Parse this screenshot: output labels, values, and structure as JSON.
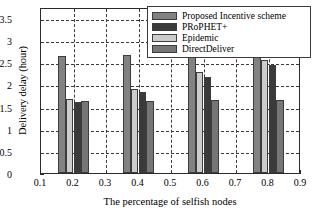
{
  "chart_data": {
    "type": "bar",
    "title": "",
    "xlabel": "The percentage of selfish nodes",
    "ylabel": "Delivery delay (hour)",
    "categories": [
      "0.2",
      "0.4",
      "0.6",
      "0.8"
    ],
    "x": [
      0.2,
      0.4,
      0.6,
      0.8
    ],
    "xlim": [
      0.1,
      0.9
    ],
    "ylim": [
      0,
      3.75
    ],
    "xticks": [
      "0.1",
      "0.2",
      "0.3",
      "0.4",
      "0.5",
      "0.6",
      "0.7",
      "0.8",
      "0.9"
    ],
    "yticks": [
      "0",
      "0.5",
      "1",
      "1.5",
      "2",
      "2.5",
      "3",
      "3.5"
    ],
    "grid": true,
    "legend_position": "top-right",
    "series": [
      {
        "name": "Proposed Incentive scheme",
        "color": "#828282",
        "values": [
          2.65,
          2.66,
          2.64,
          2.64
        ]
      },
      {
        "name": "PRoPHET+",
        "color": "#3a3a3a",
        "values": [
          1.6,
          1.84,
          2.18,
          2.43
        ]
      },
      {
        "name": "Epidemic",
        "color": "#cccccc",
        "values": [
          1.68,
          1.9,
          2.29,
          2.56
        ]
      },
      {
        "name": "DirectDeliver",
        "color": "#767676",
        "values": [
          1.63,
          1.63,
          1.65,
          1.65
        ]
      }
    ],
    "draw_order": [
      "Proposed Incentive scheme",
      "Epidemic",
      "PRoPHET+",
      "DirectDeliver"
    ]
  },
  "legend": {
    "items": [
      {
        "label": "Proposed Incentive scheme",
        "color": "#828282"
      },
      {
        "label": "PRoPHET+",
        "color": "#3a3a3a"
      },
      {
        "label": "Epidemic",
        "color": "#cccccc"
      },
      {
        "label": "DirectDeliver",
        "color": "#767676"
      }
    ]
  },
  "axes": {
    "y_title": "Delivery delay (hour)",
    "x_title": "The percentage of selfish nodes"
  }
}
